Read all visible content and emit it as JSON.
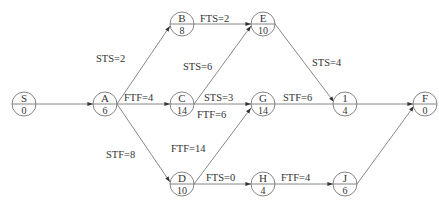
{
  "diagram": {
    "type": "precedence-network",
    "nodes": [
      {
        "id": "S",
        "label": "S",
        "duration": "0",
        "x": 24,
        "y": 104
      },
      {
        "id": "A",
        "label": "A",
        "duration": "6",
        "x": 105,
        "y": 104
      },
      {
        "id": "B",
        "label": "B",
        "duration": "8",
        "x": 182,
        "y": 24
      },
      {
        "id": "C",
        "label": "C",
        "duration": "14",
        "x": 182,
        "y": 104
      },
      {
        "id": "D",
        "label": "D",
        "duration": "10",
        "x": 182,
        "y": 184
      },
      {
        "id": "E",
        "label": "E",
        "duration": "10",
        "x": 263,
        "y": 24
      },
      {
        "id": "G",
        "label": "G",
        "duration": "14",
        "x": 263,
        "y": 104
      },
      {
        "id": "H",
        "label": "H",
        "duration": "4",
        "x": 263,
        "y": 184
      },
      {
        "id": "1",
        "label": "1",
        "duration": "4",
        "x": 345,
        "y": 104
      },
      {
        "id": "J",
        "label": "J",
        "duration": "6",
        "x": 345,
        "y": 184
      },
      {
        "id": "F",
        "label": "F",
        "duration": "0",
        "x": 425,
        "y": 104
      }
    ],
    "edges": [
      {
        "from": "S",
        "to": "A",
        "label": ""
      },
      {
        "from": "A",
        "to": "B",
        "label": "STS=2"
      },
      {
        "from": "A",
        "to": "C",
        "label": "FTF=4"
      },
      {
        "from": "A",
        "to": "D",
        "label": "STF=8"
      },
      {
        "from": "B",
        "to": "E",
        "label": "FTS=2"
      },
      {
        "from": "C",
        "to": "E",
        "label": "STS=6"
      },
      {
        "from": "C",
        "to": "G",
        "label": "STS=3"
      },
      {
        "from": "C",
        "to": "G",
        "label": "FTF=6"
      },
      {
        "from": "D",
        "to": "G",
        "label": "FTF=14"
      },
      {
        "from": "D",
        "to": "H",
        "label": "FTS=0"
      },
      {
        "from": "E",
        "to": "1",
        "label": "STS=4"
      },
      {
        "from": "G",
        "to": "1",
        "label": "STF=6"
      },
      {
        "from": "H",
        "to": "J",
        "label": "FTF=4"
      },
      {
        "from": "1",
        "to": "F",
        "label": ""
      },
      {
        "from": "J",
        "to": "F",
        "label": ""
      }
    ]
  },
  "labels": {
    "a_b": "STS=2",
    "a_c": "FTF=4",
    "a_d": "STF=8",
    "b_e": "FTS=2",
    "c_e": "STS=6",
    "c_g_sts": "STS=3",
    "c_g_ftf": "FTF=6",
    "d_g": "FTF=14",
    "d_h": "FTS=0",
    "e_1": "STS=4",
    "g_1": "STF=6",
    "h_j": "FTF=4"
  },
  "nodes": {
    "S": {
      "label": "S",
      "duration": "0"
    },
    "A": {
      "label": "A",
      "duration": "6"
    },
    "B": {
      "label": "B",
      "duration": "8"
    },
    "C": {
      "label": "C",
      "duration": "14"
    },
    "D": {
      "label": "D",
      "duration": "10"
    },
    "E": {
      "label": "E",
      "duration": "10"
    },
    "G": {
      "label": "G",
      "duration": "14"
    },
    "H": {
      "label": "H",
      "duration": "4"
    },
    "N1": {
      "label": "1",
      "duration": "4"
    },
    "J": {
      "label": "J",
      "duration": "6"
    },
    "F": {
      "label": "F",
      "duration": "0"
    }
  }
}
